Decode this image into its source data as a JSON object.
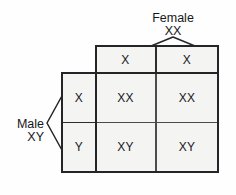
{
  "diagram": {
    "type": "punnett-square",
    "parents": {
      "top": {
        "name": "Female",
        "genotype": "XX",
        "bracket": "caret-down-icon"
      },
      "left": {
        "name": "Male",
        "genotype": "XY",
        "bracket": "caret-left-icon"
      }
    },
    "column_headers": [
      "X",
      "X"
    ],
    "row_headers": [
      "X",
      "Y"
    ],
    "offspring": [
      [
        "XX",
        "XX"
      ],
      [
        "XY",
        "XY"
      ]
    ],
    "watermark": "",
    "colors": {
      "cell_fill": "#f4f4f3",
      "outer_stroke": "#232527",
      "inner_stroke": "#4a4c4e",
      "text": "#17191b",
      "background": "#fefefe"
    }
  }
}
